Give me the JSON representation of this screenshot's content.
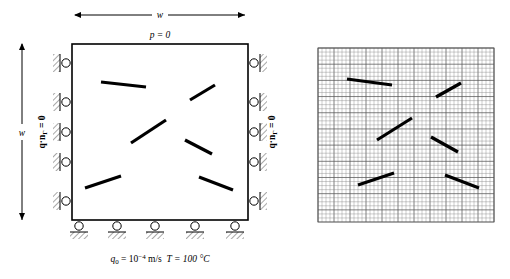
{
  "figure": {
    "title_hidden": "",
    "left_panel": {
      "name": "boundary-value-problem-schematic",
      "domain_shape": "square",
      "top_dimension_label": "w",
      "left_dimension_label": "w",
      "top_boundary_condition": "p = 0",
      "left_boundary_condition": "q·n",
      "left_boundary_condition_sub": "Γ",
      "left_boundary_condition_eq": " = 0",
      "right_boundary_condition": "q·n",
      "right_boundary_condition_sub": "Γ",
      "right_boundary_condition_eq": " = 0",
      "bottom_flux_symbol": "q",
      "bottom_flux_sub": "0",
      "bottom_flux_eq": " = 10",
      "bottom_flux_exp": "−4",
      "bottom_flux_unit": " m/s",
      "bottom_temp": "T = 100 °C",
      "roller_count_left": 5,
      "roller_count_right": 5,
      "roller_count_bottom": 5,
      "fractures": [
        {
          "x1": 101,
          "y1": 82,
          "x2": 146,
          "y2": 87
        },
        {
          "x1": 190,
          "y1": 100,
          "x2": 215,
          "y2": 85
        },
        {
          "x1": 131,
          "y1": 143,
          "x2": 166,
          "y2": 120
        },
        {
          "x1": 185,
          "y1": 140,
          "x2": 212,
          "y2": 154
        },
        {
          "x1": 85,
          "y1": 188,
          "x2": 121,
          "y2": 176
        },
        {
          "x1": 199,
          "y1": 177,
          "x2": 233,
          "y2": 190
        }
      ],
      "square": {
        "x": 72,
        "y": 44,
        "w": 176,
        "h": 176
      }
    },
    "right_panel": {
      "name": "finite-element-mesh",
      "mesh": {
        "x": 318,
        "y": 48,
        "w": 176,
        "h": 174,
        "cols": 44,
        "rows": 43
      },
      "fractures": [
        {
          "x1": 347,
          "y1": 79,
          "x2": 392,
          "y2": 85
        },
        {
          "x1": 436,
          "y1": 97,
          "x2": 461,
          "y2": 83
        },
        {
          "x1": 377,
          "y1": 140,
          "x2": 412,
          "y2": 118
        },
        {
          "x1": 431,
          "y1": 137,
          "x2": 458,
          "y2": 152
        },
        {
          "x1": 358,
          "y1": 185,
          "x2": 394,
          "y2": 173
        },
        {
          "x1": 445,
          "y1": 175,
          "x2": 479,
          "y2": 188
        }
      ]
    },
    "colors": {
      "line": "#000000",
      "fracture": "#000000",
      "mesh_grid": "#808080",
      "mesh_grid_major": "#555555",
      "background": "#ffffff"
    }
  }
}
